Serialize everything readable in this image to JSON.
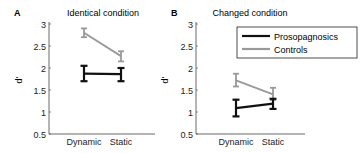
{
  "chart_data": [
    {
      "panel_label": "A",
      "type": "line",
      "title": "Identical condition",
      "xlabel": "",
      "ylabel": "d'",
      "categories": [
        "Dynamic",
        "Static"
      ],
      "ylim": [
        0.5,
        3
      ],
      "yticks": [
        "3",
        "2.5",
        "2",
        "1.5",
        "1",
        "0.5"
      ],
      "grid": false,
      "series": [
        {
          "name": "Prosopagnosics",
          "color": "#111111",
          "values": [
            1.87,
            1.86
          ],
          "err_low": [
            1.7,
            1.7
          ],
          "err_high": [
            2.05,
            2.0
          ]
        },
        {
          "name": "Controls",
          "color": "#999999",
          "values": [
            2.8,
            2.27
          ],
          "err_low": [
            2.7,
            2.15
          ],
          "err_high": [
            2.9,
            2.38
          ]
        }
      ]
    },
    {
      "panel_label": "B",
      "type": "line",
      "title": "Changed condition",
      "xlabel": "",
      "ylabel": "d'",
      "categories": [
        "Dynamic",
        "Static"
      ],
      "ylim": [
        0.5,
        3
      ],
      "yticks": [
        "3",
        "2.5",
        "2",
        "1.5",
        "1",
        "0.5"
      ],
      "grid": false,
      "legend": {
        "position": "upper right",
        "entries": [
          "Prosopagnosics",
          "Controls"
        ]
      },
      "series": [
        {
          "name": "Prosopagnosics",
          "color": "#111111",
          "values": [
            1.09,
            1.19
          ],
          "err_low": [
            0.9,
            1.07
          ],
          "err_high": [
            1.28,
            1.3
          ]
        },
        {
          "name": "Controls",
          "color": "#999999",
          "values": [
            1.72,
            1.4
          ],
          "err_low": [
            1.58,
            1.27
          ],
          "err_high": [
            1.87,
            1.55
          ]
        }
      ]
    }
  ]
}
